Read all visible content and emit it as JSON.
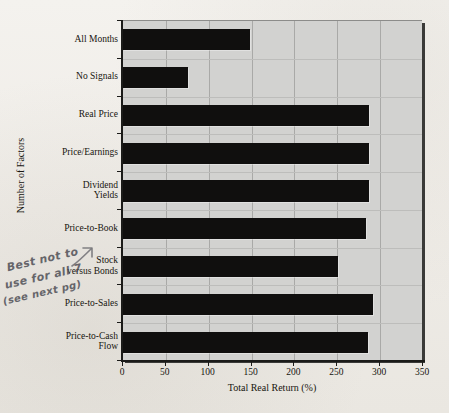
{
  "chart_data": {
    "type": "bar",
    "orientation": "horizontal",
    "title": "",
    "xlabel": "Total Real Return (%)",
    "ylabel": "Number of Factors",
    "xlim": [
      0,
      350
    ],
    "xticks": [
      0,
      50,
      100,
      150,
      200,
      250,
      300,
      350
    ],
    "grid": true,
    "legend": "none",
    "categories": [
      "All Months",
      "No Signals",
      "Real Price",
      "Price/Earnings",
      "Dividend Yields",
      "Price-to-Book",
      "Stock versus Bonds",
      "Price-to-Sales",
      "Price-to-Cash Flow"
    ],
    "category_lines": [
      [
        "All Months"
      ],
      [
        "No Signals"
      ],
      [
        "Real Price"
      ],
      [
        "Price/Earnings"
      ],
      [
        "Dividend",
        "Yields"
      ],
      [
        "Price-to-Book"
      ],
      [
        "Stock",
        "versus Bonds"
      ],
      [
        "Price-to-Sales"
      ],
      [
        "Price-to-Cash",
        "Flow"
      ]
    ],
    "values": [
      148,
      76,
      287,
      287,
      287,
      284,
      251,
      292,
      286
    ],
    "bar_color": "#100f0e",
    "plot_background": "#d2d2d0",
    "figure_background": "#f2f0ec"
  },
  "annotation": {
    "line1": "Best not to",
    "line2": "use for all 7",
    "line3": "(see next pg)",
    "ink_color": "#4a4a52"
  }
}
